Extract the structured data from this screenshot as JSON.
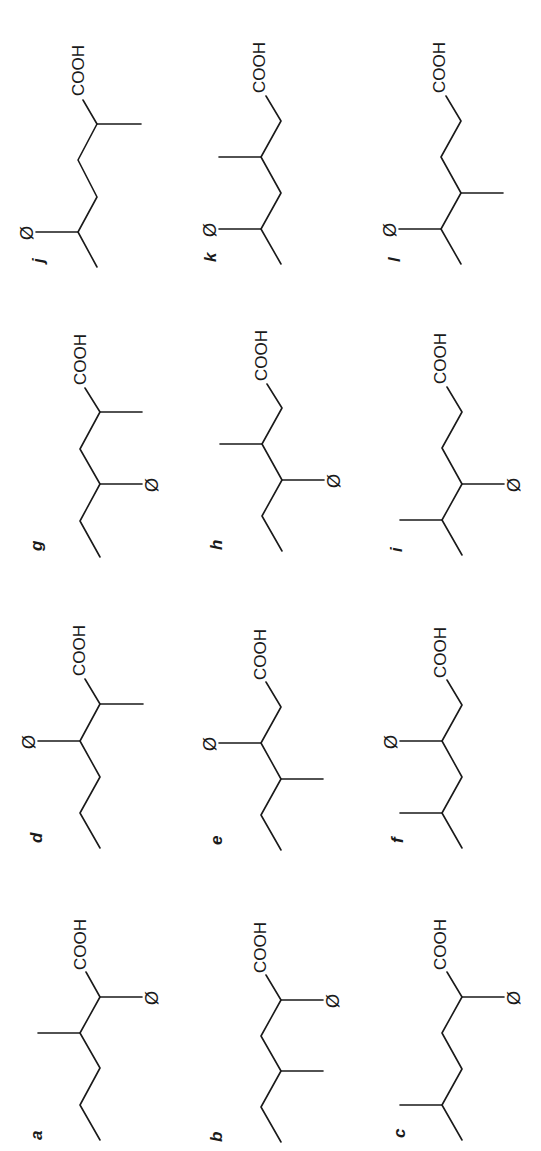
{
  "figure": {
    "orientation": "rotated 90 degrees counter-clockwise",
    "functional_group": "COOH",
    "substituent_symbol": "Ø",
    "compounds": [
      {
        "label": "a",
        "description": "2-phenyl-3-methylhexanoic acid skeleton: Ø on C2, methyl on C3"
      },
      {
        "label": "b",
        "description": "Ø on C2, methyl on C4"
      },
      {
        "label": "c",
        "description": "Ø on C2, methyl on C5"
      },
      {
        "label": "d",
        "description": "methyl on C2, Ø on C3"
      },
      {
        "label": "e",
        "description": "Ø on C3, methyl on C4"
      },
      {
        "label": "f",
        "description": "Ø on C3, methyl on C5"
      },
      {
        "label": "g",
        "description": "methyl on C2, Ø on C4"
      },
      {
        "label": "h",
        "description": "methyl on C3, Ø on C4"
      },
      {
        "label": "i",
        "description": "Ø on C4, methyl on C5"
      },
      {
        "label": "j",
        "description": "methyl on C2, Ø on C5"
      },
      {
        "label": "k",
        "description": "methyl on C3, Ø on C5"
      },
      {
        "label": "l",
        "description": "methyl on C4, Ø on C5"
      }
    ]
  }
}
